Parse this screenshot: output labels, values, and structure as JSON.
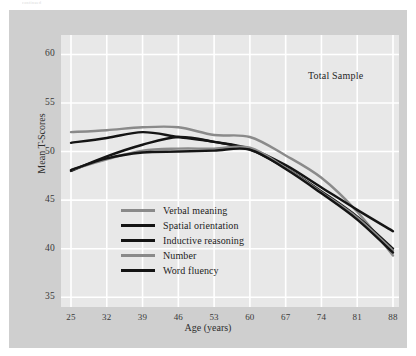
{
  "caption_top": "continued",
  "annotation": "Total Sample",
  "axes": {
    "ylabel": "Mean T-Scores",
    "xlabel": "Age (years)",
    "yticks": [
      "60",
      "55",
      "50",
      "45",
      "40",
      "35"
    ],
    "xticks": [
      "25",
      "32",
      "39",
      "46",
      "53",
      "60",
      "67",
      "74",
      "81",
      "88"
    ]
  },
  "legend": [
    {
      "label": "Verbal meaning",
      "color": "#8a8a8a"
    },
    {
      "label": "Spatial orientation",
      "color": "#141414"
    },
    {
      "label": "Inductive reasoning",
      "color": "#141414"
    },
    {
      "label": "Number",
      "color": "#8a8a8a"
    },
    {
      "label": "Word fluency",
      "color": "#141414"
    }
  ],
  "colors": {
    "figure_background": "#ffffff",
    "panel_background": "#cfcfcf",
    "plot_background": "#e8e8e8",
    "gridline": "#ffffff",
    "gray_series": "#8a8a8a",
    "black_series": "#141414",
    "tick_text": "#3a3a3a",
    "label_text": "#262626"
  },
  "chart_data": {
    "type": "line",
    "title": "",
    "subtitle": "",
    "annotation": "Total Sample",
    "xlabel": "Age (years)",
    "ylabel": "Mean T-Scores",
    "x": [
      25,
      32,
      39,
      46,
      53,
      60,
      67,
      74,
      81,
      88
    ],
    "xlim": [
      25,
      88
    ],
    "ylim": [
      34,
      62
    ],
    "yticks": [
      35,
      40,
      45,
      50,
      55,
      60
    ],
    "xticks": [
      25,
      32,
      39,
      46,
      53,
      60,
      67,
      74,
      81,
      88
    ],
    "grid": true,
    "legend_position": "inside-lower-left",
    "series": [
      {
        "name": "Verbal meaning",
        "color": "#8a8a8a",
        "values": [
          52.0,
          52.2,
          52.5,
          52.5,
          51.7,
          51.5,
          49.6,
          47.3,
          43.8,
          39.3
        ]
      },
      {
        "name": "Spatial orientation",
        "color": "#141414",
        "values": [
          50.9,
          51.4,
          52.0,
          51.5,
          51.0,
          50.3,
          48.6,
          46.3,
          44.0,
          41.8
        ]
      },
      {
        "name": "Inductive reasoning",
        "color": "#141414",
        "values": [
          48.0,
          49.5,
          50.7,
          51.5,
          51.0,
          50.2,
          48.3,
          45.9,
          43.3,
          40.0
        ]
      },
      {
        "name": "Number",
        "color": "#8a8a8a",
        "values": [
          48.1,
          49.2,
          50.1,
          50.3,
          50.3,
          50.4,
          48.3,
          45.8,
          43.2,
          39.8
        ]
      },
      {
        "name": "Word fluency",
        "color": "#141414",
        "values": [
          48.1,
          49.3,
          49.9,
          50.0,
          50.1,
          50.2,
          48.2,
          45.7,
          43.0,
          39.6
        ]
      }
    ]
  }
}
